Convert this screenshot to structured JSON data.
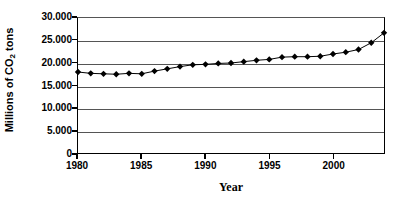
{
  "chart_data": {
    "type": "line",
    "title": "",
    "subtitle": "",
    "xlabel": "Year",
    "ylabel": "Millions of CO2 tons",
    "ylabel_parts": {
      "prefix": "Millions of CO",
      "sub": "2",
      "suffix": " tons"
    },
    "xlim": [
      1980,
      2004
    ],
    "ylim": [
      0,
      30000
    ],
    "ytick_labels": [
      "30.000",
      "25.000",
      "20.000",
      "15.000",
      "10.000",
      "5.000",
      "0"
    ],
    "ytick_values": [
      30000,
      25000,
      20000,
      15000,
      10000,
      5000,
      0
    ],
    "xtick_labels": [
      "1980",
      "1985",
      "1990",
      "1995",
      "2000"
    ],
    "xtick_values": [
      1980,
      1985,
      1990,
      1995,
      2000
    ],
    "grid": "horizontal",
    "legend": "none",
    "marker": "diamond",
    "marker_color": "#000000",
    "line_color": "#000000",
    "x": [
      1980,
      1981,
      1982,
      1983,
      1984,
      1985,
      1986,
      1987,
      1988,
      1989,
      1990,
      1991,
      1992,
      1993,
      1994,
      1995,
      1996,
      1997,
      1998,
      1999,
      2000,
      2001,
      2002,
      2003,
      2004
    ],
    "values": [
      18000,
      17700,
      17600,
      17500,
      17700,
      17600,
      18200,
      18700,
      19200,
      19600,
      19700,
      19900,
      20000,
      20300,
      20600,
      20800,
      21300,
      21400,
      21400,
      21500,
      22000,
      22400,
      23000,
      24500,
      26700
    ],
    "series": [
      {
        "name": "CO2 emissions",
        "values": [
          18000,
          17700,
          17600,
          17500,
          17700,
          17600,
          18200,
          18700,
          19200,
          19600,
          19700,
          19900,
          20000,
          20300,
          20600,
          20800,
          21300,
          21400,
          21400,
          21500,
          22000,
          22400,
          23000,
          24500,
          26700
        ]
      }
    ]
  }
}
